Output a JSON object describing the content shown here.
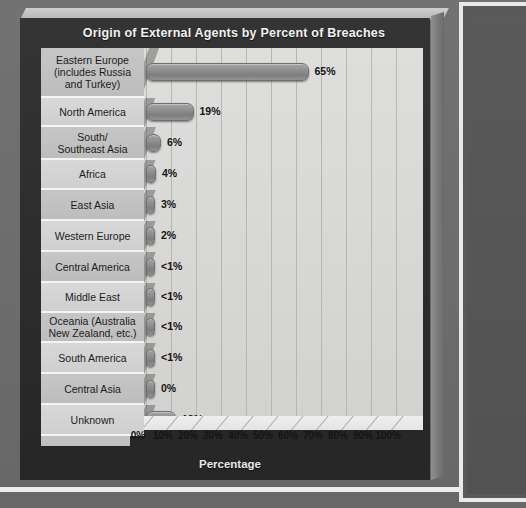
{
  "chart": {
    "title": "Origin of External Agents by Percent of Breaches",
    "axis_title": "Percentage"
  },
  "chart_data": {
    "type": "bar",
    "orientation": "horizontal",
    "title": "Origin of External Agents by Percent of Breaches",
    "xlabel": "Percentage",
    "ylabel": "",
    "xlim": [
      0,
      100
    ],
    "grid": true,
    "legend": "none",
    "categories": [
      "Eastern Europe (includes Russia and Turkey)",
      "North America",
      "South/ Southeast Asia",
      "Africa",
      "East Asia",
      "Western Europe",
      "Central America",
      "Middle East",
      "Oceania (Australia New Zealand, etc.)",
      "South America",
      "Central Asia",
      "Unknown"
    ],
    "values": [
      65,
      19,
      6,
      4,
      3,
      2,
      0.5,
      0.5,
      0.5,
      0.5,
      0,
      12
    ],
    "value_labels": [
      "65%",
      "19%",
      "6%",
      "4%",
      "3%",
      "2%",
      "<1%",
      "<1%",
      "<1%",
      "<1%",
      "0%",
      "12%"
    ],
    "tick_labels": [
      "0%",
      "10%",
      "20%",
      "30%",
      "40%",
      "50%",
      "60%",
      "70%",
      "80%",
      "90%",
      "100%"
    ],
    "tick_values": [
      0,
      10,
      20,
      30,
      40,
      50,
      60,
      70,
      80,
      90,
      100
    ]
  },
  "rows": [
    {
      "label_line1": "Eastern Europe",
      "label_line2": "(includes Russia",
      "label_line3": "and Turkey)",
      "value": 65,
      "value_label": "65%",
      "height": 50
    },
    {
      "label_line1": "North America",
      "label_line2": "",
      "label_line3": "",
      "value": 19,
      "value_label": "19%",
      "height": 29
    },
    {
      "label_line1": "South/",
      "label_line2": "Southeast Asia",
      "label_line3": "",
      "value": 6,
      "value_label": "6%",
      "height": 33
    },
    {
      "label_line1": "Africa",
      "label_line2": "",
      "label_line3": "",
      "value": 4,
      "value_label": "4%",
      "height": 30
    },
    {
      "label_line1": "East Asia",
      "label_line2": "",
      "label_line3": "",
      "value": 3,
      "value_label": "3%",
      "height": 31
    },
    {
      "label_line1": "Western Europe",
      "label_line2": "",
      "label_line3": "",
      "value": 2,
      "value_label": "2%",
      "height": 31
    },
    {
      "label_line1": "Central America",
      "label_line2": "",
      "label_line3": "",
      "value": 0.5,
      "value_label": "<1%",
      "height": 31
    },
    {
      "label_line1": "Middle East",
      "label_line2": "",
      "label_line3": "",
      "value": 0.5,
      "value_label": "<1%",
      "height": 30
    },
    {
      "label_line1": "Oceania (Australia",
      "label_line2": "New Zealand, etc.)",
      "label_line3": "",
      "value": 0.5,
      "value_label": "<1%",
      "height": 30
    },
    {
      "label_line1": "South America",
      "label_line2": "",
      "label_line3": "",
      "value": 0.5,
      "value_label": "<1%",
      "height": 31
    },
    {
      "label_line1": "Central Asia",
      "label_line2": "",
      "label_line3": "",
      "value": 0,
      "value_label": "0%",
      "height": 31
    },
    {
      "label_line1": "Unknown",
      "label_line2": "",
      "label_line3": "",
      "value": 12,
      "value_label": "12%",
      "height": 31
    }
  ],
  "colors": {
    "page_background": "#6d6d6d",
    "frame_dark": "#2f2f2f",
    "plot_background": "#dedede",
    "bar_fill": "#8e8e8e",
    "label_shade_a": "#c6c6c6",
    "label_shade_b": "#d8d8d8",
    "title_text": "#f2f2f2",
    "panel_border": "#e9e9e9"
  }
}
